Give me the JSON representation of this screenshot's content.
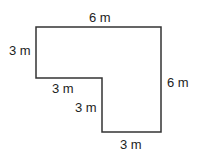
{
  "diagram": {
    "shape": "L-shaped polygon",
    "stroke_color": "#333333",
    "labels": {
      "top": "6 m",
      "left": "3 m",
      "inner_horizontal": "3 m",
      "inner_vertical": "3 m",
      "right": "6 m",
      "bottom": "3 m"
    }
  }
}
